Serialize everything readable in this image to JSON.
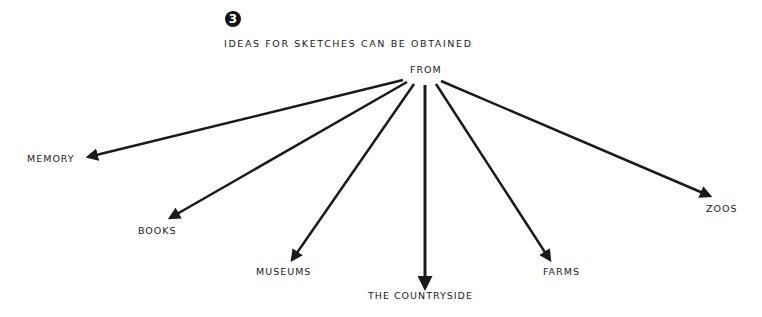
{
  "figure": {
    "number": "3",
    "title": "IDEAS FOR SKETCHES CAN BE OBTAINED",
    "source": "FROM"
  },
  "targets": [
    {
      "label": "MEMORY"
    },
    {
      "label": "BOOKS"
    },
    {
      "label": "MUSEUMS"
    },
    {
      "label": "THE COUNTRYSIDE"
    },
    {
      "label": "FARMS"
    },
    {
      "label": "ZOOS"
    }
  ],
  "colors": {
    "ink": "#1a1a1a",
    "background": "#ffffff"
  }
}
